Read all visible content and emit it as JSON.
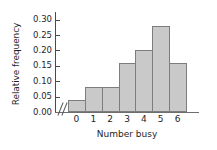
{
  "chart_data": {
    "type": "bar",
    "title": "",
    "xlabel": "Number busy",
    "ylabel": "Relative frequency",
    "categories": [
      "0",
      "1",
      "2",
      "3",
      "4",
      "5",
      "6"
    ],
    "values": [
      0.04,
      0.08,
      0.08,
      0.16,
      0.2,
      0.28,
      0.16
    ],
    "ylim": [
      0.0,
      0.325
    ],
    "ytick_values": [
      0.0,
      0.05,
      0.1,
      0.15,
      0.2,
      0.25,
      0.3
    ],
    "ytick_labels": [
      "0.00",
      "0.05",
      "0.10",
      "0.15",
      "0.20",
      "0.25",
      "0.30"
    ],
    "xtick_labels": [
      "0",
      "1",
      "2",
      "3",
      "4",
      "5",
      "6"
    ],
    "grid": false,
    "legend": null,
    "axis_break": "//",
    "bar_fill_color": "#c9c9c9",
    "bar_edge_color": "#7d7d7d",
    "axis_color": "#4a4a4a",
    "background_color": "#ffffff"
  }
}
